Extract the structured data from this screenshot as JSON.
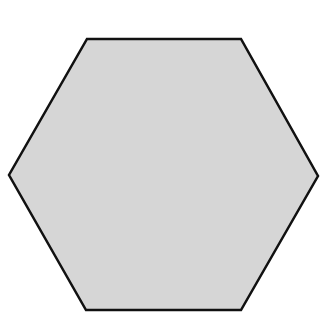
{
  "shape": {
    "type": "hexagon",
    "fill": "#d6d6d6",
    "stroke": "#111111",
    "stroke_width": 2.5,
    "points": "87,39 241,39 318,176 241,310 86,310 9,175"
  }
}
